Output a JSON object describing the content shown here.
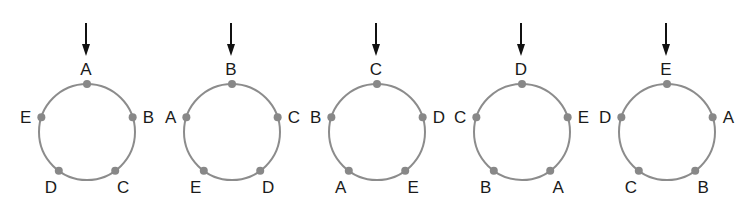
{
  "diagram": {
    "colors": {
      "ring": "#8c8c8c",
      "dot": "#888888",
      "arrow": "#111111",
      "label": "#1a1a1a"
    },
    "rings": [
      {
        "top": "A",
        "upper_right": "B",
        "lower_right": "C",
        "lower_left": "D",
        "upper_left": "E"
      },
      {
        "top": "B",
        "upper_right": "C",
        "lower_right": "D",
        "lower_left": "E",
        "upper_left": "A"
      },
      {
        "top": "C",
        "upper_right": "D",
        "lower_right": "E",
        "lower_left": "A",
        "upper_left": "B"
      },
      {
        "top": "D",
        "upper_right": "E",
        "lower_right": "A",
        "lower_left": "B",
        "upper_left": "C"
      },
      {
        "top": "E",
        "upper_right": "A",
        "lower_right": "B",
        "lower_left": "C",
        "upper_left": "D"
      }
    ]
  }
}
